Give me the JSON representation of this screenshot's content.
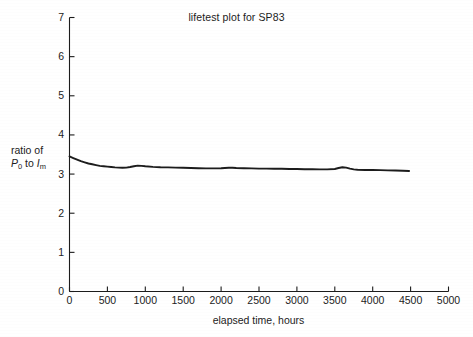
{
  "figure": {
    "background_color": "#ffffff",
    "ink_color": "#1c1c1c",
    "title": "lifetest plot for SP83",
    "xaxis_title": "elapsed time, hours",
    "yaxis_title_line1": "ratio of",
    "yaxis_title_line2_prefix": "P",
    "yaxis_title_line2_sub1": "0",
    "yaxis_title_line2_mid": " to ",
    "yaxis_title_line2_suffix": "I",
    "yaxis_title_line2_sub2": "m"
  },
  "chart_data": {
    "type": "line",
    "title": "lifetest plot for SP83",
    "xlabel": "elapsed time, hours",
    "ylabel": "ratio of P0 to Im",
    "xlim": [
      0,
      5000
    ],
    "ylim": [
      0,
      7
    ],
    "xticks": [
      0,
      500,
      1000,
      1500,
      2000,
      2500,
      3000,
      3500,
      4000,
      4500,
      5000
    ],
    "xtick_labels": [
      "0",
      "500",
      "1000",
      "1500",
      "2000",
      "2500",
      "3000",
      "3500",
      "4000",
      "4500",
      "5000"
    ],
    "yticks": [
      0,
      1,
      2,
      3,
      4,
      5,
      6,
      7
    ],
    "ytick_labels": [
      "0",
      "1",
      "2",
      "3",
      "4",
      "5",
      "6",
      "7"
    ],
    "grid": false,
    "legend": false,
    "tick_direction": "in",
    "series": [
      {
        "name": "ratio of P0 to Im",
        "color": "#1c1c1c",
        "line_width": 1.9,
        "x": [
          0,
          50,
          100,
          150,
          200,
          250,
          300,
          350,
          400,
          450,
          500,
          550,
          600,
          650,
          700,
          750,
          800,
          850,
          900,
          950,
          1000,
          1100,
          1200,
          1300,
          1400,
          1500,
          1600,
          1700,
          1800,
          1900,
          2000,
          2050,
          2100,
          2150,
          2200,
          2300,
          2400,
          2500,
          2600,
          2700,
          2800,
          2900,
          3000,
          3100,
          3200,
          3300,
          3400,
          3500,
          3550,
          3600,
          3650,
          3700,
          3750,
          3800,
          3900,
          4000,
          4100,
          4200,
          4300,
          4400,
          4480
        ],
        "y": [
          3.45,
          3.41,
          3.37,
          3.33,
          3.3,
          3.27,
          3.25,
          3.23,
          3.21,
          3.2,
          3.19,
          3.18,
          3.17,
          3.165,
          3.16,
          3.165,
          3.18,
          3.2,
          3.215,
          3.21,
          3.2,
          3.185,
          3.175,
          3.17,
          3.165,
          3.16,
          3.155,
          3.15,
          3.145,
          3.145,
          3.15,
          3.155,
          3.16,
          3.16,
          3.155,
          3.15,
          3.145,
          3.14,
          3.14,
          3.135,
          3.135,
          3.13,
          3.13,
          3.125,
          3.125,
          3.12,
          3.12,
          3.13,
          3.155,
          3.175,
          3.165,
          3.14,
          3.12,
          3.11,
          3.105,
          3.105,
          3.1,
          3.095,
          3.09,
          3.085,
          3.08
        ]
      }
    ]
  }
}
